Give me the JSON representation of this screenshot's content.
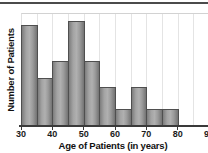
{
  "chart_data": {
    "type": "bar",
    "subtype": "histogram",
    "title": "",
    "xlabel": "Age of Patients (in years)",
    "ylabel": "Number of Patients",
    "categories": [
      "30-35",
      "35-40",
      "40-45",
      "45-50",
      "50-55",
      "55-60",
      "60-65",
      "65-70",
      "70-75",
      "75-80"
    ],
    "values": [
      23,
      11,
      15,
      24,
      15,
      9,
      4,
      9,
      4,
      4
    ],
    "bin_start": 30,
    "bin_width": 5,
    "xlim": [
      30,
      90
    ],
    "ylim": [
      0,
      25.5
    ],
    "x_ticks": [
      30,
      40,
      50,
      60,
      70,
      80,
      90
    ],
    "y_ticks_labeled": false,
    "grid": "vertical",
    "legend": "none",
    "bar_color": "#9b9b9b",
    "bar_border_color": "#4f4f4f",
    "axis_color": "#3a3a3a",
    "gridline_color": "#e4e4e4",
    "top_rule_color": "#4b4b4b",
    "text_color": "#111111"
  }
}
